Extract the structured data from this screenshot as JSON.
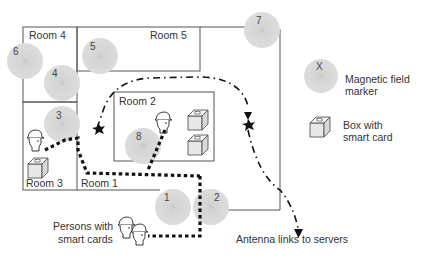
{
  "rooms": [
    {
      "id": "room-1",
      "label": "Room 1"
    },
    {
      "id": "room-2",
      "label": "Room 2"
    },
    {
      "id": "room-3",
      "label": "Room 3"
    },
    {
      "id": "room-4",
      "label": "Room 4"
    },
    {
      "id": "room-5",
      "label": "Room 5"
    }
  ],
  "markers": [
    {
      "label": "1"
    },
    {
      "label": "2"
    },
    {
      "label": "3"
    },
    {
      "label": "4"
    },
    {
      "label": "5"
    },
    {
      "label": "6"
    },
    {
      "label": "7"
    },
    {
      "label": "8"
    }
  ],
  "legend": {
    "marker_symbol": "X",
    "marker_line1": "Magnetic field",
    "marker_line2": "marker",
    "box_line1": "Box with",
    "box_line2": "smart card"
  },
  "annotations": {
    "persons_line1": "Persons with",
    "persons_line2": "smart cards",
    "antenna": "Antenna links to servers"
  },
  "colors": {
    "marker_fill": "#d6d6d6",
    "marker_center": "#c4c4c4",
    "wall": "#555555",
    "path": "#111111"
  }
}
